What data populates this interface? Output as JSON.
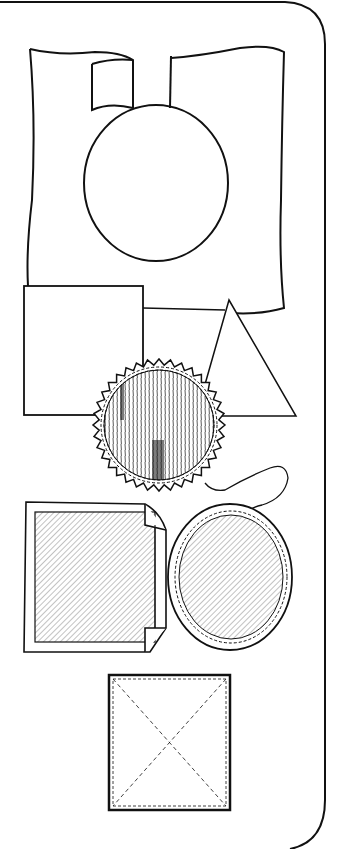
{
  "figure": {
    "caption": "",
    "ink_color": "#111111",
    "paper_color": "#ffffff",
    "shapes": [
      {
        "id": "wavy-sheet-with-slot",
        "label": "Wavy sheet with slot and circle cut-out"
      },
      {
        "id": "plain-square",
        "label": "Plain square"
      },
      {
        "id": "triangle",
        "label": "Triangle"
      },
      {
        "id": "serrated-seal",
        "label": "Serrated round seal with hatching"
      },
      {
        "id": "folded-corner-square",
        "label": "Hatched square with folded corners"
      },
      {
        "id": "round-seal-with-string",
        "label": "Hatched round seal with string"
      },
      {
        "id": "dashed-square-with-x",
        "label": "Square with dashed inner border and X diagonals"
      }
    ]
  }
}
